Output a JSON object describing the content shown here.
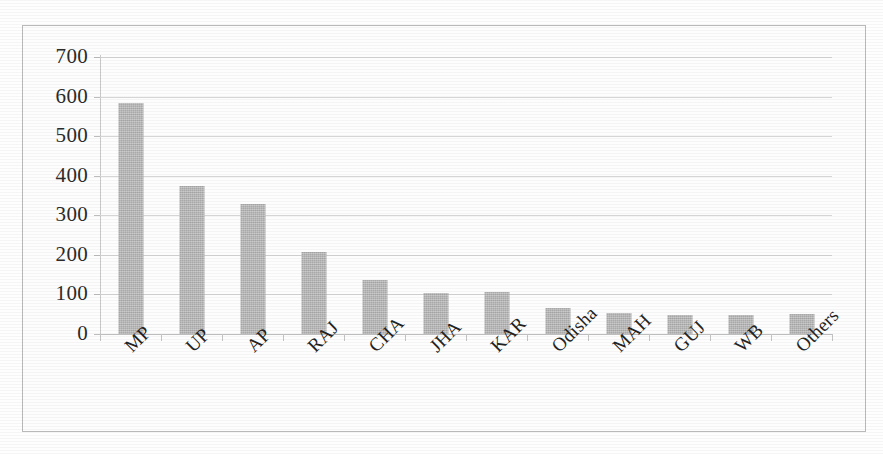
{
  "chart_data": {
    "type": "bar",
    "title": "",
    "subtitle": "",
    "xlabel": "",
    "ylabel": "",
    "categories": [
      "MP",
      "UP",
      "AP",
      "RAJ",
      "CHA",
      "JHA",
      "KAR",
      "Odisha",
      "MAH",
      "GUJ",
      "WB",
      "Others"
    ],
    "values": [
      583,
      373,
      328,
      208,
      137,
      104,
      105,
      65,
      53,
      48,
      49,
      51
    ],
    "series": [
      {
        "name": "",
        "values": [
          583,
          373,
          328,
          208,
          137,
          104,
          105,
          65,
          53,
          48,
          49,
          51
        ]
      }
    ],
    "ylim": [
      0,
      700
    ],
    "ytick_values": [
      700,
      600,
      500,
      400,
      300,
      200,
      100,
      0
    ],
    "ytick_labels": [
      "700",
      "600",
      "500",
      "400",
      "300",
      "200",
      "100",
      "0"
    ],
    "ytick_interval": 100,
    "grid": "horizontal",
    "legend": "none",
    "bar_color": "#b6b6b6",
    "gridline_color": "#d5d5d5",
    "axis_color": "#c2c2c2",
    "text_color": "#232323",
    "background_color": "#fdfdfd",
    "border_color": "#b9b9b9",
    "xtick_label_rotation": "-45"
  }
}
